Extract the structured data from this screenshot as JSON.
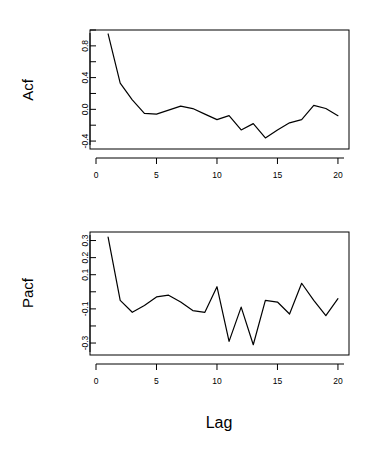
{
  "figure": {
    "xlabel": "Lag",
    "background": "#ffffff",
    "line_color": "#000000"
  },
  "panels": [
    {
      "id": "acf",
      "ylabel": "Acf",
      "y_tick_labels": [
        "0.8",
        "0.4",
        "0.0",
        "-0.4"
      ],
      "x_tick_labels": [
        "0",
        "5",
        "10",
        "15",
        "20"
      ]
    },
    {
      "id": "pacf",
      "ylabel": "Pacf",
      "y_tick_labels": [
        "0.3",
        "0.2",
        "0.1",
        "-0.1",
        "-0.3"
      ],
      "x_tick_labels": [
        "0",
        "5",
        "10",
        "15",
        "20"
      ]
    }
  ],
  "chart_data": [
    {
      "type": "line",
      "id": "acf",
      "title": "",
      "xlabel": "",
      "ylabel": "Acf",
      "xlim": [
        0,
        20.5
      ],
      "ylim": [
        -0.5,
        1.0
      ],
      "grid": false,
      "legend": "none",
      "x_ticks": [
        0,
        5,
        10,
        15,
        20
      ],
      "y_ticks": [
        -0.4,
        -0.2,
        0.0,
        0.2,
        0.4,
        0.6,
        0.8,
        1.0
      ],
      "y_tick_labels_shown": [
        0.8,
        0.4,
        0.0,
        -0.4
      ],
      "x": [
        1,
        2,
        3,
        4,
        5,
        6,
        7,
        8,
        9,
        10,
        11,
        12,
        13,
        14,
        15,
        16,
        17,
        18,
        19,
        20
      ],
      "values": [
        0.95,
        0.33,
        0.12,
        -0.05,
        -0.06,
        -0.01,
        0.04,
        0.01,
        -0.06,
        -0.13,
        -0.08,
        -0.26,
        -0.18,
        -0.36,
        -0.26,
        -0.17,
        -0.13,
        0.05,
        0.01,
        -0.08
      ]
    },
    {
      "type": "line",
      "id": "pacf",
      "title": "",
      "xlabel": "Lag",
      "ylabel": "Pacf",
      "xlim": [
        0,
        20.5
      ],
      "ylim": [
        -0.37,
        0.35
      ],
      "grid": false,
      "legend": "none",
      "x_ticks": [
        0,
        5,
        10,
        15,
        20
      ],
      "y_ticks": [
        -0.3,
        -0.2,
        -0.1,
        0.0,
        0.1,
        0.2,
        0.3
      ],
      "y_tick_labels_shown": [
        0.3,
        0.2,
        0.1,
        -0.1,
        -0.3
      ],
      "x": [
        1,
        2,
        3,
        4,
        5,
        6,
        7,
        8,
        9,
        10,
        11,
        12,
        13,
        14,
        15,
        16,
        17,
        18,
        19,
        20
      ],
      "values": [
        0.32,
        -0.05,
        -0.12,
        -0.08,
        -0.03,
        -0.02,
        -0.06,
        -0.11,
        -0.12,
        0.03,
        -0.29,
        -0.09,
        -0.31,
        -0.05,
        -0.06,
        -0.13,
        0.05,
        -0.05,
        -0.14,
        -0.04
      ]
    }
  ]
}
